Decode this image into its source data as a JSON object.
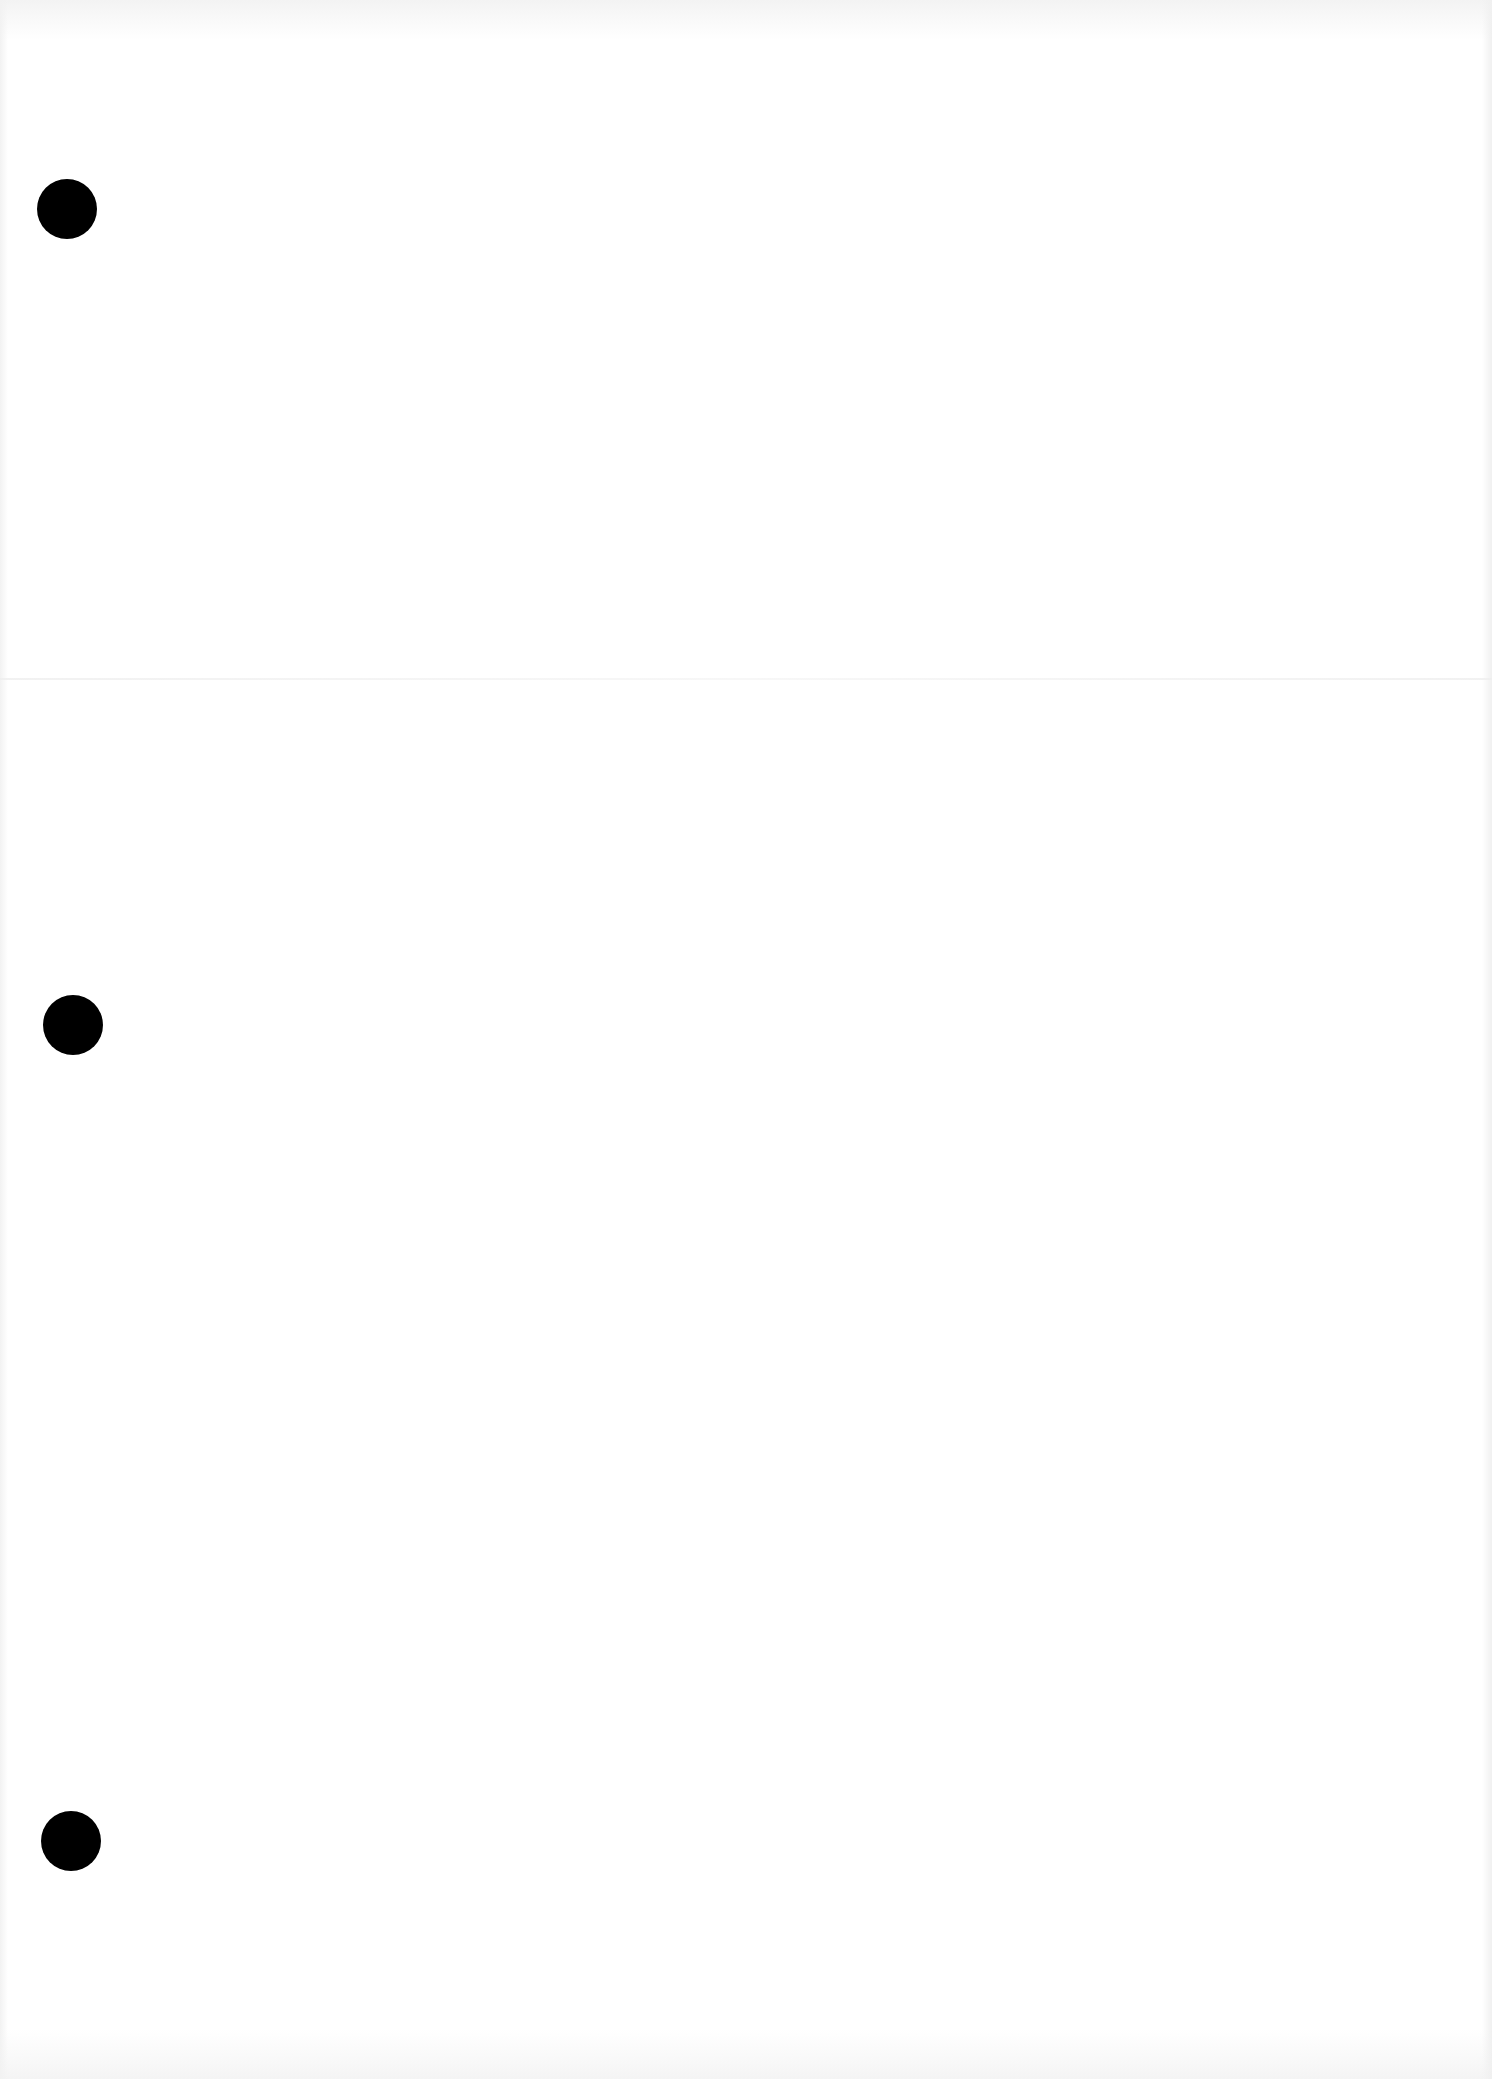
{
  "page": {
    "type": "blank-scanned-sheet",
    "background_color": "#ffffff",
    "text_content": ""
  },
  "punch_holes": [
    {
      "left": 37,
      "top": 179,
      "diameter": 60,
      "color": "#000000"
    },
    {
      "left": 43,
      "top": 995,
      "diameter": 60,
      "color": "#000000"
    },
    {
      "left": 41,
      "top": 1811,
      "diameter": 60,
      "color": "#000000"
    }
  ]
}
